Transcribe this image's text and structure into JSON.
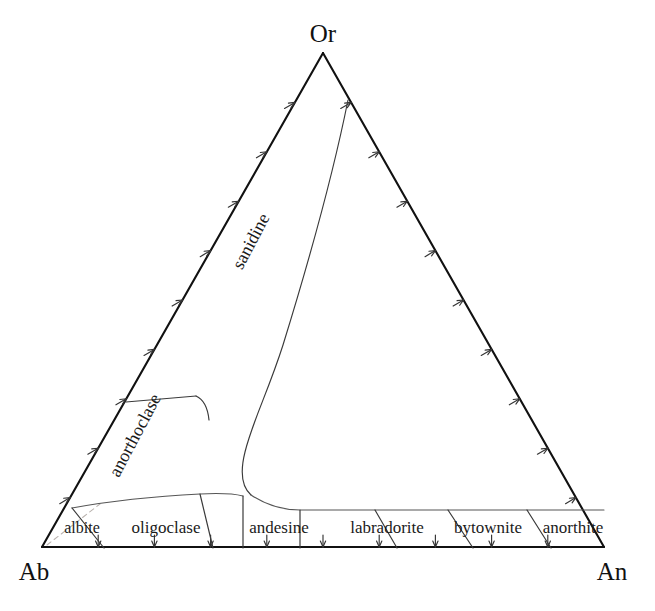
{
  "figure": {
    "kind": "ternary-phase-diagram",
    "background_color": "#ffffff",
    "line_color": "#111111",
    "curve_color": "#3a3a3a",
    "guide_color": "#b9b2ae"
  },
  "apexes": {
    "top": {
      "label": "Or",
      "x": 323,
      "y": 53
    },
    "bottom_left": {
      "label": "Ab",
      "x": 42,
      "y": 547
    },
    "bottom_right": {
      "label": "An",
      "x": 604,
      "y": 547
    }
  },
  "apex_label_positions": {
    "top": {
      "x": 323,
      "y": 42
    },
    "bottom_left": {
      "x": 34,
      "y": 580
    },
    "bottom_right": {
      "x": 612,
      "y": 580
    }
  },
  "edges": [
    {
      "name": "ab-or-edge",
      "from": "Ab",
      "to": "Or",
      "tick_count": 9,
      "tick_direction": "inward-up-right"
    },
    {
      "name": "or-an-edge",
      "from": "Or",
      "to": "An",
      "tick_count": 9,
      "tick_direction": "inward-up-right"
    },
    {
      "name": "ab-an-edge",
      "from": "Ab",
      "to": "An",
      "tick_count": 9,
      "tick_direction": "inward-down"
    }
  ],
  "alkali_feldspar_fields": [
    {
      "id": "sanidine",
      "label": "sanidine",
      "label_x": 256,
      "label_y": 244,
      "rotation": 62
    },
    {
      "id": "anorthoclase",
      "label": "anorthoclase",
      "label_x": 140,
      "label_y": 438,
      "rotation": 62
    }
  ],
  "plagioclase_fields": [
    {
      "id": "albite",
      "label": "albite",
      "label_x": 82,
      "label_y": 533
    },
    {
      "id": "oligoclase",
      "label": "oligoclase",
      "label_x": 166,
      "label_y": 533
    },
    {
      "id": "andesine",
      "label": "andesine",
      "label_x": 279,
      "label_y": 533
    },
    {
      "id": "labradorite",
      "label": "labradorite",
      "label_x": 387,
      "label_y": 533
    },
    {
      "id": "bytownite",
      "label": "bytownite",
      "label_x": 488,
      "label_y": 533
    },
    {
      "id": "anorthite",
      "label": "anorthite",
      "label_x": 573,
      "label_y": 533
    }
  ],
  "geometry": {
    "solvus_path": "M 348,100 C 330,190 300,290 283,345 C 268,392 253,420 245,452 C 240,472 242,487 251,495",
    "solvus_lower_path": "M 251,495 C 266,505 282,510 300,510 L 604,510",
    "anorthoclase_divider": "M 126,402 L 196,396",
    "sanidine_anorthoclase_boundary": "M 196,396 C 205,400 208,410 209,420",
    "plag_top_left_path": "M 72,508 C 110,501 160,496 200,494 C 220,493 235,494 243,496",
    "plag_top_right_path": "M 251,495 C 266,505 282,510 300,510 L 604,510",
    "field_dividers": [
      "M 72,508 L 104,548",
      "M 200,494 L 213,548",
      "M 243,496 L 243,548",
      "M 300,510 L 300,548",
      "M 375,510 L 397,548",
      "M 448,510 L 473,548",
      "M 527,510 L 551,548"
    ],
    "faint_guide": "M 47,545 L 100,504"
  },
  "chart_data": {
    "type": "ternary",
    "title": "",
    "components": [
      "Ab",
      "An",
      "Or"
    ],
    "fields": [
      {
        "name": "sanidine",
        "group": "alkali feldspar"
      },
      {
        "name": "anorthoclase",
        "group": "alkali feldspar"
      },
      {
        "name": "albite",
        "group": "plagioclase",
        "an_range": [
          0,
          10
        ]
      },
      {
        "name": "oligoclase",
        "group": "plagioclase",
        "an_range": [
          10,
          30
        ]
      },
      {
        "name": "andesine",
        "group": "plagioclase",
        "an_range": [
          30,
          50
        ]
      },
      {
        "name": "labradorite",
        "group": "plagioclase",
        "an_range": [
          50,
          70
        ]
      },
      {
        "name": "bytownite",
        "group": "plagioclase",
        "an_range": [
          70,
          90
        ]
      },
      {
        "name": "anorthite",
        "group": "plagioclase",
        "an_range": [
          90,
          100
        ]
      }
    ],
    "axis_ticks": {
      "per_edge": 9,
      "interval_percent": 10
    },
    "grid": false,
    "legend": "none"
  }
}
